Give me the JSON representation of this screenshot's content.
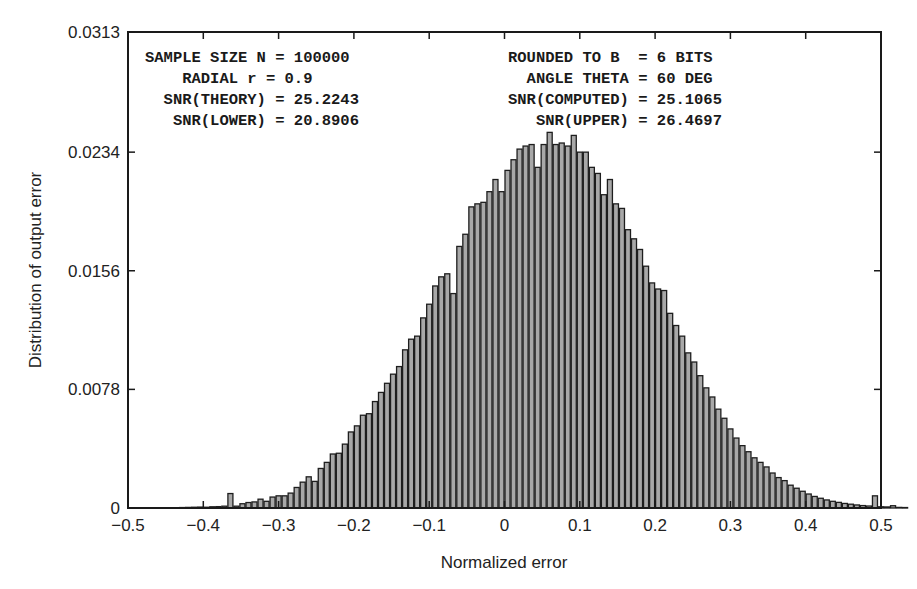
{
  "chart_data": {
    "type": "bar",
    "subtype": "histogram",
    "title": "",
    "xlabel": "Normalized error",
    "ylabel": "Distribution of output error",
    "xlim": [
      -0.5,
      0.5
    ],
    "ylim": [
      0,
      0.0313
    ],
    "x_ticks": [
      "−0.5",
      "−0.4",
      "−0.3",
      "−0.2",
      "−0.1",
      "0",
      "0.1",
      "0.2",
      "0.3",
      "0.4",
      "0.5"
    ],
    "x_tick_values": [
      -0.5,
      -0.4,
      -0.3,
      -0.2,
      -0.1,
      0,
      0.1,
      0.2,
      0.3,
      0.4,
      0.5
    ],
    "y_ticks": [
      "0",
      "0.0078",
      "0.0156",
      "0.0234",
      "0.0313"
    ],
    "y_tick_values": [
      0,
      0.0078,
      0.0156,
      0.0234,
      0.0313
    ],
    "grid": false,
    "legend": null,
    "bin_start": -0.44,
    "bin_width": 0.008,
    "values": [
      2e-05,
      3e-05,
      4e-05,
      5e-05,
      6e-05,
      5e-05,
      8e-05,
      9e-05,
      0.00012,
      0.00095,
      0.00012,
      0.00028,
      0.00036,
      0.0004,
      0.00058,
      0.00044,
      0.00072,
      0.0008,
      0.0008,
      0.00098,
      0.00135,
      0.0017,
      0.00205,
      0.00175,
      0.0026,
      0.003,
      0.00355,
      0.0036,
      0.0042,
      0.005,
      0.0054,
      0.0061,
      0.0062,
      0.007,
      0.0076,
      0.0082,
      0.0088,
      0.0093,
      0.0104,
      0.0111,
      0.0113,
      0.0125,
      0.0134,
      0.0146,
      0.0152,
      0.0154,
      0.0141,
      0.0172,
      0.018,
      0.0198,
      0.02,
      0.0201,
      0.0208,
      0.0216,
      0.0208,
      0.0222,
      0.0229,
      0.0236,
      0.0238,
      0.0239,
      0.0224,
      0.0239,
      0.0247,
      0.0239,
      0.024,
      0.0238,
      0.0245,
      0.0234,
      0.0234,
      0.0224,
      0.022,
      0.0206,
      0.0216,
      0.02,
      0.0197,
      0.0183,
      0.0177,
      0.017,
      0.0159,
      0.0148,
      0.0144,
      0.0143,
      0.0128,
      0.012,
      0.0113,
      0.0102,
      0.0096,
      0.0087,
      0.0079,
      0.0073,
      0.0065,
      0.0059,
      0.0052,
      0.0046,
      0.0041,
      0.0037,
      0.0033,
      0.003,
      0.0027,
      0.0023,
      0.002,
      0.0018,
      0.0015,
      0.0013,
      0.0011,
      0.00092,
      0.00076,
      0.00064,
      0.00053,
      0.00044,
      0.00037,
      0.0003,
      0.00025,
      0.0002,
      0.00016,
      0.00013,
      0.0008,
      8e-05,
      7e-05,
      0.00015,
      4e-05,
      3e-05
    ],
    "annotations": {
      "left": [
        "SAMPLE SIZE N = 100000",
        "    RADIAL r = 0.9",
        "  SNR(THEORY) = 25.2243",
        "   SNR(LOWER) = 20.8906"
      ],
      "right": [
        "ROUNDED TO B  = 6 BITS",
        "  ANGLE THETA = 60 DEG",
        "SNR(COMPUTED) = 25.1065",
        "   SNR(UPPER) = 26.4697"
      ]
    },
    "parameters": {
      "sample_size_N": 100000,
      "radial_r": 0.9,
      "rounded_bits_B": 6,
      "angle_theta_deg": 60,
      "snr_theory": 25.2243,
      "snr_computed": 25.1065,
      "snr_lower": 20.8906,
      "snr_upper": 26.4697
    }
  },
  "colors": {
    "bar_fill": "#a8a8a8",
    "bar_edge": "#1e1e1e",
    "axis": "#1a1a1a",
    "background": "#ffffff"
  },
  "layout": {
    "plot_left": 128,
    "plot_top": 32,
    "plot_right": 881,
    "plot_bottom": 508
  }
}
